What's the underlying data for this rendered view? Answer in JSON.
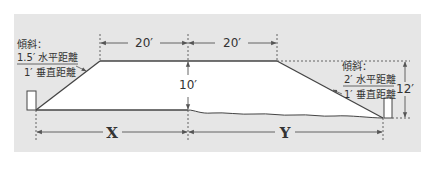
{
  "diagram": {
    "type": "embankment-cross-section",
    "colors": {
      "background": "#e6e6e6",
      "section_fill": "#ffffff",
      "line": "#444444",
      "dim_line": "#555555",
      "text": "#333333"
    },
    "top_width_left": "20′",
    "top_width_right": "20′",
    "left_height": "10′",
    "right_height": "12′",
    "left_slope": {
      "title": "傾斜：",
      "numerator": "1.5′ 水平距離",
      "denominator": "1′ 垂直距離"
    },
    "right_slope": {
      "title": "傾斜：",
      "numerator": "2′ 水平距離",
      "denominator": "1′ 垂直距離"
    },
    "left_base_label": "X",
    "right_base_label": "Y"
  }
}
